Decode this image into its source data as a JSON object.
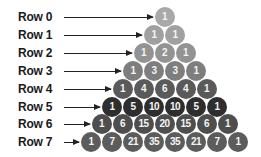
{
  "row_colors": [
    "#a9a9a9",
    "#a0a0a0",
    "#939393",
    "#7e7e7e",
    "#5a5a5a",
    "#2e2e2e",
    "#4e4e4e",
    "#5c5c5c"
  ],
  "rows": [
    {
      "label": "Row 0",
      "values": [
        "1"
      ]
    },
    {
      "label": "Row 1",
      "values": [
        "1",
        "1"
      ]
    },
    {
      "label": "Row 2",
      "values": [
        "1",
        "2",
        "1"
      ]
    },
    {
      "label": "Row 3",
      "values": [
        "1",
        "3",
        "3",
        "1"
      ]
    },
    {
      "label": "Row 4",
      "values": [
        "1",
        "4",
        "6",
        "4",
        "1"
      ]
    },
    {
      "label": "Row 5",
      "values": [
        "1",
        "5",
        "10",
        "10",
        "5",
        "1"
      ]
    },
    {
      "label": "Row 6",
      "values": [
        "1",
        "6",
        "15",
        "20",
        "15",
        "6",
        "1"
      ]
    },
    {
      "label": "Row 7",
      "values": [
        "1",
        "7",
        "21",
        "35",
        "35",
        "21",
        "7",
        "1"
      ]
    }
  ]
}
